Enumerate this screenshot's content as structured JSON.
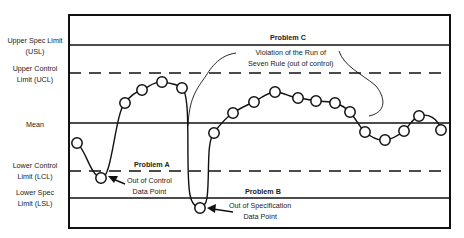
{
  "diagram": {
    "type": "control-chart",
    "limits": [
      {
        "key": "usl",
        "label_line1": "Upper Spec Limit",
        "label_line2": "(USL)",
        "y": 45,
        "style": "solid"
      },
      {
        "key": "ucl",
        "label_line1": "Upper Control",
        "label_line2": "Limit (UCL)",
        "y": 73,
        "style": "dashed"
      },
      {
        "key": "mean",
        "label_line1": "Mean",
        "label_line2": "",
        "y": 123,
        "style": "solid"
      },
      {
        "key": "lcl",
        "label_line1": "Lower Control",
        "label_line2": "Limit (LCL)",
        "y": 171,
        "style": "dashed"
      },
      {
        "key": "lsl",
        "label_line1": "Lower Spec",
        "label_line2": "Limit (LSL)",
        "y": 198,
        "style": "solid"
      }
    ],
    "problems": {
      "a": {
        "title": "Problem A",
        "line1": "Out of Control",
        "line2": "Data Point"
      },
      "b": {
        "title": "Problem B",
        "line1": "Out of Specification",
        "line2": "Data Point"
      },
      "c": {
        "title": "Problem C",
        "line1": "Violation of the Run of",
        "line2": "Seven Rule (out of control)"
      }
    },
    "points": [
      [
        77,
        143
      ],
      [
        101,
        178
      ],
      [
        125,
        103
      ],
      [
        142,
        90
      ],
      [
        162,
        82
      ],
      [
        182,
        88
      ],
      [
        200,
        208
      ],
      [
        214,
        133
      ],
      [
        233,
        113
      ],
      [
        254,
        102
      ],
      [
        275,
        92
      ],
      [
        298,
        98
      ],
      [
        316,
        101
      ],
      [
        335,
        103
      ],
      [
        350,
        112
      ],
      [
        365,
        132
      ],
      [
        385,
        140
      ],
      [
        404,
        131
      ],
      [
        419,
        116
      ],
      [
        441,
        130
      ]
    ],
    "colors": {
      "line": "#111111",
      "background": "#ffffff"
    }
  }
}
